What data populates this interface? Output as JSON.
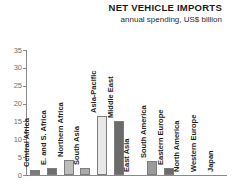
{
  "header": {
    "title": "NET VEHICLE IMPORTS",
    "subtitle": "annual spending, US$ billion"
  },
  "chart_data": {
    "type": "bar",
    "title": "NET VEHICLE IMPORTS",
    "subtitle": "annual spending, US$ billion",
    "xlabel": "",
    "ylabel": "",
    "ylim": [
      0,
      35
    ],
    "yticks": [
      0,
      5,
      10,
      15,
      20,
      25,
      30,
      35
    ],
    "ytick_labels": [
      "0",
      "5",
      "10",
      "15",
      "20",
      "25",
      "30",
      "35"
    ],
    "grid": false,
    "legend": "none",
    "orientation": "vertical",
    "label_rotation": -90,
    "categories": [
      "Central Africa",
      "E. and S. Africa",
      "Northern Africa",
      "South Asia",
      "Asia-Pacific",
      "Middle East",
      "East Asia",
      "South America",
      "Eastern Europe",
      "North America",
      "Western Europe",
      "Japan"
    ],
    "values": [
      1.5,
      2.1,
      4.1,
      2.0,
      16.6,
      15.1,
      0.0,
      3.9,
      1.9,
      0.0,
      0.0,
      0.0
    ],
    "bar_colors": [
      "#7b7b7b",
      "#6e6e6e",
      "#bdbdbd",
      "#ababab",
      "#e8e8e8",
      "#6b6b6b",
      "#9a9a9a",
      "#9a9a9a",
      "#6b6b6b",
      "#9a9a9a",
      "#9a9a9a",
      "#9a9a9a"
    ]
  },
  "colors": {
    "axis": "#8a8a8a",
    "tick_text": "#6e6e6e",
    "label_text": "#1c1c1c",
    "background": "#ffffff"
  }
}
